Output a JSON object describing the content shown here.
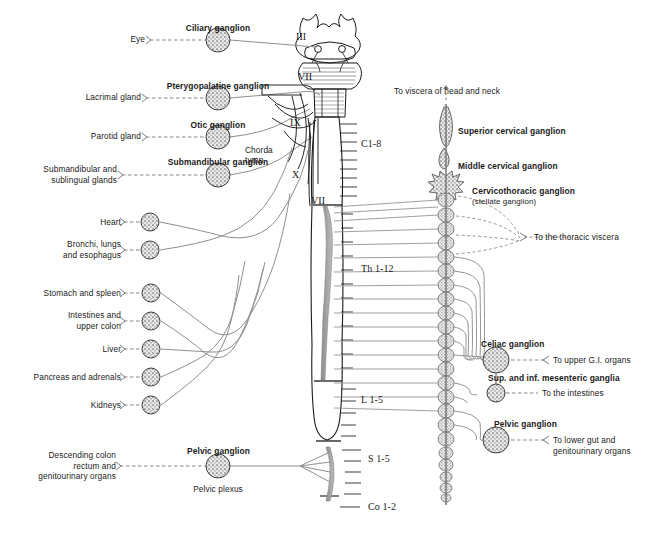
{
  "figure": {
    "background": "#ffffff",
    "ink": "#1a1a1a",
    "fiber_color": "#8a8a8a",
    "ganglion_fill": "#d9d9d9"
  },
  "parasympathetic": {
    "cranial_nerves": [
      {
        "numeral": "III",
        "x": 296,
        "y": 39
      },
      {
        "numeral": "VII",
        "x": 300,
        "y": 79
      },
      {
        "numeral": "IX",
        "x": 292,
        "y": 123
      },
      {
        "numeral": "X",
        "x": 294,
        "y": 176
      },
      {
        "numeral": "VII",
        "x": 313,
        "y": 201
      }
    ],
    "chorda": {
      "line1": "Chorda",
      "line2": "tymp."
    },
    "ganglia": [
      {
        "name": "Ciliary ganglion",
        "target": "Eye",
        "cx": 218,
        "cy": 40,
        "r": 12
      },
      {
        "name": "Pterygopalatine ganglion",
        "target": "Lacrimal gland",
        "cx": 218,
        "cy": 98,
        "r": 12
      },
      {
        "name": "Otic ganglion",
        "target": "Parotid gland",
        "cx": 218,
        "cy": 137,
        "r": 12
      },
      {
        "name": "Submandibular ganglion",
        "target": "Submandibular and\nsublingual glands",
        "cx": 218,
        "cy": 175,
        "r": 12
      },
      {
        "name": "Pelvic ganglion",
        "target": "Descending colon\nrectum and\ngenitourinary organs",
        "sub": "Pelvic plexus",
        "cx": 218,
        "cy": 466,
        "r": 12
      }
    ],
    "vagal_targets": [
      {
        "label": "Heart",
        "cx": 150,
        "cy": 222,
        "r": 9
      },
      {
        "label": "Bronchi, lungs\nand esophagus",
        "cx": 150,
        "cy": 250,
        "r": 9
      },
      {
        "label": "Stomach and spleen",
        "cx": 151,
        "cy": 293,
        "r": 9
      },
      {
        "label": "Intestines and\nupper colon",
        "cx": 151,
        "cy": 321,
        "r": 9
      },
      {
        "label": "Liver",
        "cx": 151,
        "cy": 349,
        "r": 9
      },
      {
        "label": "Pancreas and adrenals",
        "cx": 151,
        "cy": 377,
        "r": 9
      },
      {
        "label": "Kidneys",
        "cx": 151,
        "cy": 405,
        "r": 9
      }
    ]
  },
  "spinal_cord": {
    "segments": [
      {
        "label": "C1-8",
        "x": 363,
        "y": 145
      },
      {
        "label": "Th 1-12",
        "x": 363,
        "y": 270
      },
      {
        "label": "L 1-5",
        "x": 363,
        "y": 401
      },
      {
        "label": "S 1-5",
        "x": 372,
        "y": 460
      },
      {
        "label": "Co 1-2",
        "x": 372,
        "y": 508
      }
    ]
  },
  "sympathetic": {
    "top_label": "To viscera of head and neck",
    "chain_labels": [
      {
        "name": "Superior cervical ganglion",
        "x": 458,
        "y": 130
      },
      {
        "name": "Middle cervical ganglion",
        "x": 458,
        "y": 165
      },
      {
        "name": "Cervicothoracic ganglion",
        "sub": "(stellate ganglion)",
        "x": 472,
        "y": 190
      }
    ],
    "thoracic_out": "To the thoracic viscera",
    "prevertebral": [
      {
        "name": "Celiac ganglion",
        "target": "To upper G.I. organs",
        "cx": 496,
        "cy": 360,
        "r": 13
      },
      {
        "name": "Sup. and inf. mesenteric ganglia",
        "target": "To the intestines",
        "cx": 496,
        "cy": 393,
        "r": 9
      },
      {
        "name": "Pelvic ganglion",
        "target": "To lower gut and\ngenitourinary organs",
        "cx": 496,
        "cy": 440,
        "r": 13
      }
    ]
  }
}
